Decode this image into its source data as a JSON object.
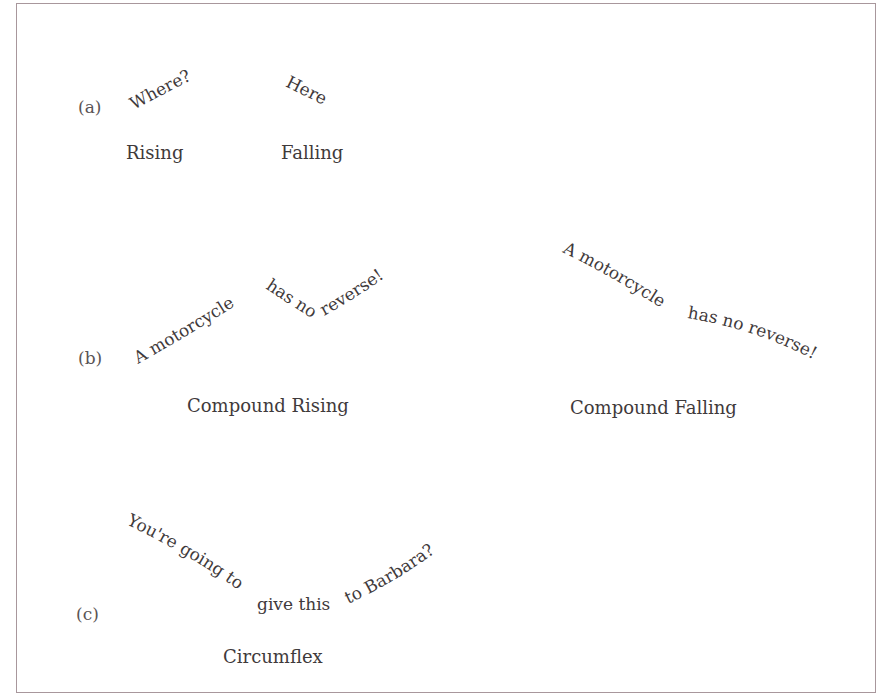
{
  "figure": {
    "border_color": "#a8979c",
    "text_color": "#3f3a3b",
    "sections": [
      {
        "id": "a",
        "label": "(a)",
        "examples": [
          {
            "contour_text": "Where?",
            "caption": "Rising"
          },
          {
            "contour_text": "Here",
            "caption": "Falling"
          }
        ]
      },
      {
        "id": "b",
        "label": "(b)",
        "examples": [
          {
            "contour_segments": [
              "A motorcycle",
              "has no",
              "reverse!"
            ],
            "caption": "Compound Rising"
          },
          {
            "contour_segments": [
              "A motorcycle",
              "has no reverse!"
            ],
            "caption": "Compound Falling"
          }
        ]
      },
      {
        "id": "c",
        "label": "(c)",
        "examples": [
          {
            "contour_segments": [
              "You're going to",
              "give this",
              "to Barbara?"
            ],
            "caption": "Circumflex"
          }
        ]
      }
    ]
  }
}
